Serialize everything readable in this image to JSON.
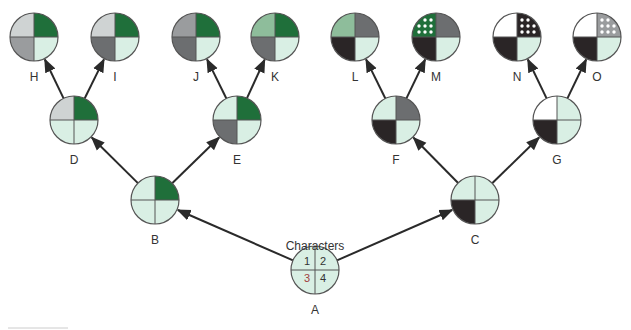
{
  "title": "Characters",
  "palette": {
    "L": "#d9efe4",
    "G": "#1f6f3a",
    "LG": "#cfd3d3",
    "MG": "#9a9c9e",
    "DG": "#6c6e70",
    "SG": "#8ebd9b",
    "BK": "#2a2526",
    "W": "#ffffff",
    "dots": "#ffffff"
  },
  "root_numbers": [
    "1",
    "2",
    "3",
    "4"
  ],
  "nodes": [
    {
      "id": "A",
      "label": "A",
      "cx": 315,
      "cy": 270,
      "q": [
        "L",
        "L",
        "L",
        "L"
      ]
    },
    {
      "id": "B",
      "label": "B",
      "cx": 155,
      "cy": 200,
      "q": [
        "L",
        "G",
        "L",
        "L"
      ]
    },
    {
      "id": "C",
      "label": "C",
      "cx": 475,
      "cy": 200,
      "q": [
        "L",
        "L",
        "BK",
        "L"
      ]
    },
    {
      "id": "D",
      "label": "D",
      "cx": 74,
      "cy": 120,
      "q": [
        "LG",
        "G",
        "L",
        "L"
      ]
    },
    {
      "id": "E",
      "label": "E",
      "cx": 237,
      "cy": 120,
      "q": [
        "L",
        "G",
        "DG",
        "L"
      ]
    },
    {
      "id": "F",
      "label": "F",
      "cx": 396,
      "cy": 120,
      "q": [
        "L",
        "DG",
        "BK",
        "L"
      ]
    },
    {
      "id": "G",
      "label": "G",
      "cx": 557,
      "cy": 120,
      "q": [
        "W",
        "L",
        "BK",
        "L"
      ]
    },
    {
      "id": "H",
      "label": "H",
      "cx": 34,
      "cy": 37,
      "q": [
        "LG",
        "G",
        "MG",
        "L"
      ]
    },
    {
      "id": "I",
      "label": "I",
      "cx": 115,
      "cy": 37,
      "q": [
        "LG",
        "G",
        "DG",
        "L"
      ]
    },
    {
      "id": "J",
      "label": "J",
      "cx": 196,
      "cy": 37,
      "q": [
        "MG",
        "G",
        "DG",
        "L"
      ]
    },
    {
      "id": "K",
      "label": "K",
      "cx": 275,
      "cy": 37,
      "q": [
        "SG",
        "G",
        "DG",
        "L"
      ]
    },
    {
      "id": "L",
      "label": "L",
      "cx": 355,
      "cy": 37,
      "q": [
        "SG",
        "DG",
        "BK",
        "L"
      ]
    },
    {
      "id": "M",
      "label": "M",
      "cx": 436,
      "cy": 37,
      "q": [
        "G*",
        "DG",
        "BK",
        "L"
      ]
    },
    {
      "id": "N",
      "label": "N",
      "cx": 517,
      "cy": 37,
      "q": [
        "W",
        "BK*",
        "BK",
        "L"
      ]
    },
    {
      "id": "O",
      "label": "O",
      "cx": 597,
      "cy": 37,
      "q": [
        "W",
        "MG*",
        "BK",
        "L"
      ]
    }
  ],
  "edges": [
    {
      "from": "A",
      "to": "B"
    },
    {
      "from": "A",
      "to": "C"
    },
    {
      "from": "B",
      "to": "D"
    },
    {
      "from": "B",
      "to": "E"
    },
    {
      "from": "C",
      "to": "F"
    },
    {
      "from": "C",
      "to": "G"
    },
    {
      "from": "D",
      "to": "H"
    },
    {
      "from": "D",
      "to": "I"
    },
    {
      "from": "E",
      "to": "J"
    },
    {
      "from": "E",
      "to": "K"
    },
    {
      "from": "F",
      "to": "L"
    },
    {
      "from": "F",
      "to": "M"
    },
    {
      "from": "G",
      "to": "N"
    },
    {
      "from": "G",
      "to": "O"
    }
  ]
}
